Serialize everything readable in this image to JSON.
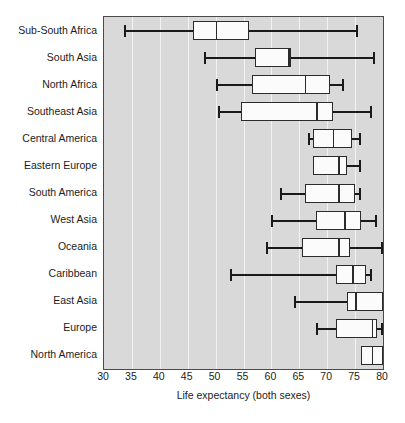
{
  "chart_data": {
    "type": "box",
    "title": "",
    "xlabel": "Life expectancy (both sexes)",
    "ylabel": "",
    "xlim": [
      30,
      80
    ],
    "xticks": [
      30,
      35,
      40,
      45,
      50,
      55,
      60,
      65,
      70,
      75,
      80
    ],
    "xtick_labels": [
      "30",
      "35",
      "40",
      "45",
      "50",
      "55",
      "60",
      "65",
      "70",
      "75",
      "80"
    ],
    "grid": "vertical-white",
    "legend": "none",
    "plot_background": "#d9d9d9",
    "box_fill": "#fbfbfb",
    "line_color": "#2b2b2b",
    "categories": [
      "Sub-South Africa",
      "South Asia",
      "North Africa",
      "Southeast Asia",
      "Central America",
      "Eastern Europe",
      "South America",
      "West Asia",
      "Oceania",
      "Caribbean",
      "East Asia",
      "Europe",
      "North America"
    ],
    "boxes": [
      {
        "category": "Sub-South Africa",
        "whisker_low": 33.5,
        "q1": 46.0,
        "median": 50.0,
        "q3": 56.0,
        "whisker_high": 75.5
      },
      {
        "category": "South Asia",
        "whisker_low": 48.0,
        "q1": 57.0,
        "median": 63.0,
        "q3": 63.5,
        "whisker_high": 78.5
      },
      {
        "category": "North Africa",
        "whisker_low": 50.0,
        "q1": 56.5,
        "median": 66.0,
        "q3": 70.5,
        "whisker_high": 73.0
      },
      {
        "category": "Southeast Asia",
        "whisker_low": 50.5,
        "q1": 54.5,
        "median": 68.0,
        "q3": 71.0,
        "whisker_high": 78.0
      },
      {
        "category": "Central America",
        "whisker_low": 66.5,
        "q1": 67.5,
        "median": 71.0,
        "q3": 74.5,
        "whisker_high": 76.0
      },
      {
        "category": "Eastern Europe",
        "whisker_low": 67.5,
        "q1": 67.5,
        "median": 72.0,
        "q3": 73.5,
        "whisker_high": 76.0
      },
      {
        "category": "South America",
        "whisker_low": 61.5,
        "q1": 66.0,
        "median": 72.0,
        "q3": 75.0,
        "whisker_high": 76.0
      },
      {
        "category": "West Asia",
        "whisker_low": 60.0,
        "q1": 68.0,
        "median": 73.0,
        "q3": 76.0,
        "whisker_high": 79.0
      },
      {
        "category": "Oceania",
        "whisker_low": 59.0,
        "q1": 65.5,
        "median": 72.0,
        "q3": 74.0,
        "whisker_high": 80.0
      },
      {
        "category": "Caribbean",
        "whisker_low": 52.5,
        "q1": 71.5,
        "median": 74.5,
        "q3": 77.0,
        "whisker_high": 78.0
      },
      {
        "category": "East Asia",
        "whisker_low": 64.0,
        "q1": 73.5,
        "median": 75.0,
        "q3": 80.0,
        "whisker_high": 80.0
      },
      {
        "category": "Europe",
        "whisker_low": 68.0,
        "q1": 71.5,
        "median": 78.0,
        "q3": 79.0,
        "whisker_high": 80.0
      },
      {
        "category": "North America",
        "whisker_low": 76.0,
        "q1": 76.0,
        "median": 78.0,
        "q3": 80.0,
        "whisker_high": 80.0
      }
    ]
  }
}
